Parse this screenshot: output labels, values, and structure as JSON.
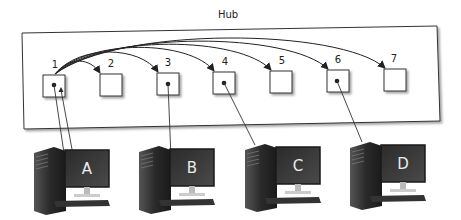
{
  "diagram": {
    "title": "Hub",
    "ports": [
      {
        "id": "1",
        "label": "1",
        "x": 43,
        "y": 75,
        "connected": true
      },
      {
        "id": "2",
        "label": "2",
        "x": 100,
        "y": 74,
        "connected": false
      },
      {
        "id": "3",
        "label": "3",
        "x": 157,
        "y": 73,
        "connected": true
      },
      {
        "id": "4",
        "label": "4",
        "x": 213,
        "y": 72,
        "connected": true
      },
      {
        "id": "5",
        "label": "5",
        "x": 270,
        "y": 71,
        "connected": false
      },
      {
        "id": "6",
        "label": "6",
        "x": 327,
        "y": 70,
        "connected": true
      },
      {
        "id": "7",
        "label": "7",
        "x": 384,
        "y": 69,
        "connected": false
      }
    ],
    "computers": [
      {
        "id": "A",
        "label": "A",
        "port": "1"
      },
      {
        "id": "B",
        "label": "B",
        "port": "3"
      },
      {
        "id": "C",
        "label": "C",
        "port": "4"
      },
      {
        "id": "D",
        "label": "D",
        "port": "6"
      }
    ],
    "broadcast": {
      "from": "1",
      "to": [
        "2",
        "3",
        "4",
        "5",
        "6",
        "7"
      ]
    },
    "colors": {
      "line": "#333333",
      "box": "#444444",
      "pc_dark": "#2e2e2e",
      "screen": "#3a3a3a"
    }
  }
}
